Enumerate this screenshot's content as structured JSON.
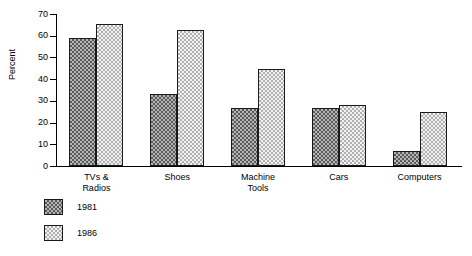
{
  "chart_data": {
    "type": "bar",
    "title": "",
    "subtitle": "",
    "xlabel": "",
    "ylabel": "Percent",
    "ylim": [
      0,
      70
    ],
    "yticks": [
      0,
      10,
      20,
      30,
      40,
      50,
      60,
      70
    ],
    "ytick_labels": [
      "0",
      "10",
      "20",
      "30",
      "40",
      "50",
      "60",
      "70"
    ],
    "grid": false,
    "legend_position": "below-left",
    "categories": [
      "TVs &\nRadios",
      "Shoes",
      "Machine\nTools",
      "Cars",
      "Computers"
    ],
    "category_labels_flat": [
      "TVs & Radios",
      "Shoes",
      "Machine Tools",
      "Cars",
      "Computers"
    ],
    "series": [
      {
        "name": "1981",
        "pattern": "dark-checkerboard",
        "color": "#7a7a7a",
        "values": [
          59,
          33,
          26.5,
          26.5,
          7
        ]
      },
      {
        "name": "1986",
        "pattern": "light-dotted",
        "color": "#e8e8e8",
        "values": [
          65.5,
          62.5,
          44.5,
          28,
          25
        ]
      }
    ]
  },
  "legend": {
    "items": [
      {
        "label": "1981"
      },
      {
        "label": "1986"
      }
    ]
  },
  "colors": {
    "axis": "#000000",
    "background": "#ffffff",
    "series_1981_fill": "#b6b6b6",
    "series_1981_ink": "#5a5a5a",
    "series_1986_fill": "#f2f2f2",
    "series_1986_ink": "#b0b0b0",
    "bar_border": "#1a1a1a"
  }
}
